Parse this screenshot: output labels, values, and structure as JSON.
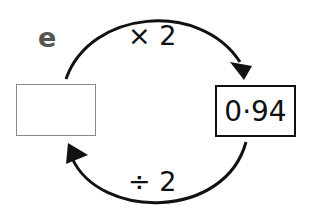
{
  "question_label": "e",
  "left_box": {
    "value": ""
  },
  "right_box": {
    "value": "0·94"
  },
  "top_operation": "× 2",
  "bottom_operation": "÷ 2",
  "colors": {
    "stroke": "#111111",
    "left_box_border": "#888888",
    "label": "#555555"
  }
}
